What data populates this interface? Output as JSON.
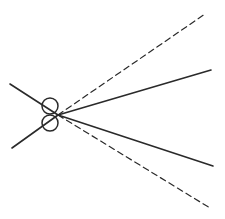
{
  "diagram": {
    "type": "scissors-cut-lines",
    "colors": {
      "stroke": "#2a2a2a",
      "background": "#ffffff"
    },
    "handles": [
      {
        "name": "upper-finger-ring",
        "cx": 50,
        "cy": 106,
        "r": 8
      },
      {
        "name": "lower-finger-ring",
        "cx": 50,
        "cy": 123,
        "r": 8
      }
    ],
    "pivot": {
      "x": 58,
      "y": 115
    },
    "blades": [
      {
        "name": "left-upper-arm",
        "x1": 10,
        "y1": 84,
        "x2": 58,
        "y2": 115,
        "style": "solid"
      },
      {
        "name": "left-lower-arm",
        "x1": 12,
        "y1": 148,
        "x2": 58,
        "y2": 115,
        "style": "solid"
      },
      {
        "name": "upper-solid-line",
        "x1": 58,
        "y1": 115,
        "x2": 211,
        "y2": 70,
        "style": "solid"
      },
      {
        "name": "lower-solid-line",
        "x1": 58,
        "y1": 115,
        "x2": 213,
        "y2": 166,
        "style": "solid"
      },
      {
        "name": "upper-dashed-line",
        "x1": 58,
        "y1": 115,
        "x2": 205,
        "y2": 14,
        "style": "dashed"
      },
      {
        "name": "lower-dashed-line",
        "x1": 58,
        "y1": 115,
        "x2": 210,
        "y2": 208,
        "style": "dashed"
      }
    ]
  }
}
